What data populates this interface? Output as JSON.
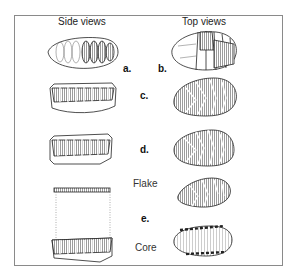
{
  "headers": {
    "side": "Side views",
    "top": "Top views"
  },
  "labels": {
    "a": "a.",
    "b": "b.",
    "c": "c.",
    "d": "d.",
    "e": "e."
  },
  "text": {
    "flake": "Flake",
    "core": "Core"
  }
}
